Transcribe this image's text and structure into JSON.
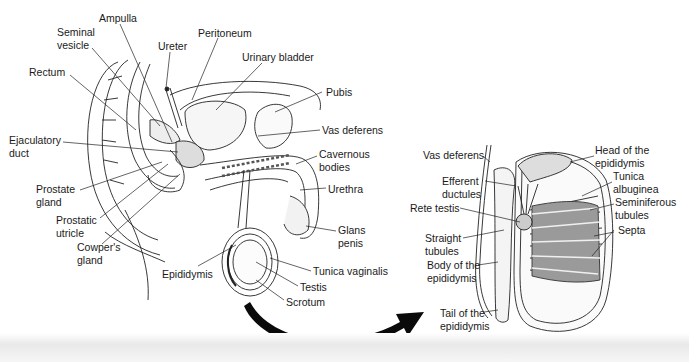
{
  "figure": {
    "left_panel": {
      "title": "Male reproductive system (sagittal section)",
      "labels": [
        {
          "id": "ampulla",
          "text": "Ampulla",
          "x": 99,
          "y": 12
        },
        {
          "id": "seminal-vesicle",
          "text": "Seminal\nvesicle",
          "x": 57,
          "y": 26
        },
        {
          "id": "ureter",
          "text": "Ureter",
          "x": 158,
          "y": 40
        },
        {
          "id": "peritoneum",
          "text": "Peritoneum",
          "x": 198,
          "y": 27
        },
        {
          "id": "urinary-bladder",
          "text": "Urinary bladder",
          "x": 242,
          "y": 51
        },
        {
          "id": "rectum",
          "text": "Rectum",
          "x": 29,
          "y": 66
        },
        {
          "id": "pubis",
          "text": "Pubis",
          "x": 326,
          "y": 86
        },
        {
          "id": "vas-deferens-left",
          "text": "Vas deferens",
          "x": 322,
          "y": 124
        },
        {
          "id": "ejaculatory-duct",
          "text": "Ejaculatory\nduct",
          "x": 9,
          "y": 134
        },
        {
          "id": "cavernous-bodies",
          "text": "Cavernous\nbodies",
          "x": 319,
          "y": 148
        },
        {
          "id": "prostate-gland",
          "text": "Prostate\ngland",
          "x": 36,
          "y": 183
        },
        {
          "id": "urethra",
          "text": "Urethra",
          "x": 328,
          "y": 183
        },
        {
          "id": "prostatic-utricle",
          "text": "Prostatic\nutricle",
          "x": 56,
          "y": 214
        },
        {
          "id": "glans-penis",
          "text": "Glans\npenis",
          "x": 338,
          "y": 224
        },
        {
          "id": "cowpers-gland",
          "text": "Cowper's\ngland",
          "x": 77,
          "y": 241
        },
        {
          "id": "epididymis",
          "text": "Epididymis",
          "x": 162,
          "y": 268
        },
        {
          "id": "tunica-vaginalis",
          "text": "Tunica vaginalis",
          "x": 313,
          "y": 265
        },
        {
          "id": "testis",
          "text": "Testis",
          "x": 300,
          "y": 281
        },
        {
          "id": "scrotum",
          "text": "Scrotum",
          "x": 286,
          "y": 296
        }
      ]
    },
    "right_panel": {
      "title": "Testis and epididymis (section)",
      "labels": [
        {
          "id": "vas-deferens-right",
          "text": "Vas deferens",
          "x": 423,
          "y": 149
        },
        {
          "id": "head-of-epididymis",
          "text": "Head of the\nepididymis",
          "x": 595,
          "y": 144
        },
        {
          "id": "efferent-ductules",
          "text": "Efferent\nductules",
          "x": 442,
          "y": 175
        },
        {
          "id": "tunica-albuginea",
          "text": "Tunica\nalbuginea",
          "x": 613,
          "y": 170
        },
        {
          "id": "rete-testis",
          "text": "Rete testis",
          "x": 410,
          "y": 202
        },
        {
          "id": "seminiferous-tubules",
          "text": "Seminiferous\ntubules",
          "x": 615,
          "y": 196
        },
        {
          "id": "septa",
          "text": "Septa",
          "x": 618,
          "y": 224
        },
        {
          "id": "straight-tubules",
          "text": "Straight\ntubules",
          "x": 425,
          "y": 232
        },
        {
          "id": "body-of-epididymis",
          "text": "Body of the\nepididymis",
          "x": 427,
          "y": 259
        },
        {
          "id": "tail-of-epididymis",
          "text": "Tail of the\nepididymis",
          "x": 440,
          "y": 307
        }
      ]
    },
    "arrow": {
      "from": "testis-left",
      "to": "testis-section-right",
      "color": "#000000"
    }
  }
}
